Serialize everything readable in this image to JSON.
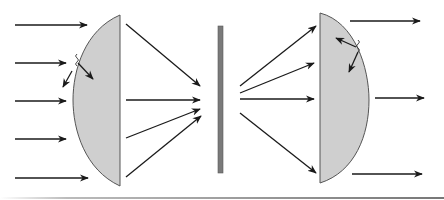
{
  "diagram": {
    "description": "Parallel rays pass through a plano-convex lens, converge toward an aperture/slit screen, diverge, and are recollimated by a second plano-convex lens; small reflection arrows with wavy markers shown at each lens's curved surface.",
    "colors": {
      "lens_fill": "#cfcfcf",
      "lens_stroke": "#555555",
      "screen_fill": "#7a7a7a",
      "ray": "#1a1a1a",
      "bottom_rule": "#888888"
    },
    "elements": [
      {
        "id": "lens-left",
        "type": "plano-convex-lens",
        "flat_side": "right"
      },
      {
        "id": "screen-center",
        "type": "slit-screen"
      },
      {
        "id": "lens-right",
        "type": "plano-convex-lens",
        "flat_side": "left"
      }
    ],
    "incoming_rays_count": 5,
    "outgoing_rays_count": 3,
    "reflection_markers": 2
  }
}
